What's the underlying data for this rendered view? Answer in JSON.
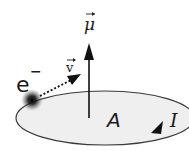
{
  "diagram": {
    "labels": {
      "moment": "μ",
      "electron": "e",
      "electron_charge": "−",
      "velocity": "v",
      "area": "A",
      "current": "I"
    },
    "colors": {
      "loop_fill": "#efefef",
      "loop_stroke": "#3a3a3a",
      "arrow": "#111111",
      "electron": "#1a1a1a"
    }
  }
}
